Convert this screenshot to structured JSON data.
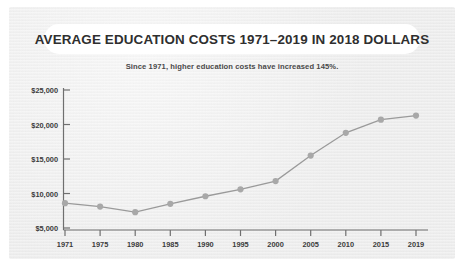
{
  "card": {
    "title": "AVERAGE EDUCATION COSTS 1971–2019 IN 2018 DOLLARS",
    "subtitle": "Since 1971, higher education costs have increased 145%.",
    "background_color": "#ececec",
    "title_pill_color": "#ffffff",
    "title_text_color": "#2f2f2f"
  },
  "chart_data": {
    "type": "line",
    "title": "AVERAGE EDUCATION COSTS 1971–2019 IN 2018 DOLLARS",
    "subtitle": "Since 1971, higher education costs have increased 145%.",
    "xlabel": "",
    "ylabel": "",
    "x": [
      "1971",
      "1975",
      "1980",
      "1985",
      "1990",
      "1995",
      "2000",
      "2005",
      "2010",
      "2015",
      "2019"
    ],
    "categories": [
      "1971",
      "1975",
      "1980",
      "1985",
      "1990",
      "1995",
      "2000",
      "2005",
      "2010",
      "2015",
      "2019"
    ],
    "values": [
      8600,
      8100,
      7300,
      8500,
      9600,
      10600,
      11800,
      15500,
      18800,
      20700,
      21300
    ],
    "series": [
      {
        "name": "Average education cost (2018 dollars)",
        "values": [
          8600,
          8100,
          7300,
          8500,
          9600,
          10600,
          11800,
          15500,
          18800,
          20700,
          21300
        ]
      }
    ],
    "ylim": [
      5000,
      25000
    ],
    "yticks": [
      5000,
      10000,
      15000,
      20000,
      25000
    ],
    "ytick_labels": [
      "$5,000",
      "$10,000",
      "$15,000",
      "$20,000",
      "$25,000"
    ],
    "xtick_labels": [
      "1971",
      "1975",
      "1980",
      "1985",
      "1990",
      "1995",
      "2000",
      "2005",
      "2010",
      "2015",
      "2019"
    ],
    "grid": false,
    "legend": "none",
    "line_color": "#9a9a9a",
    "marker_color": "#a8a8a8",
    "axis_color": "#6f6f6f"
  }
}
